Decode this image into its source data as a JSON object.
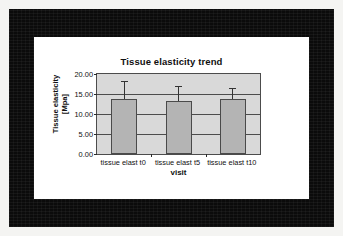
{
  "chart_data": {
    "type": "bar",
    "title": "Tissue elasticity trend",
    "xlabel": "visit",
    "ylabel": "Tissue elasticity [Mpa]",
    "ylabel_line1": "Tissue elasticity",
    "ylabel_line2": "[Mpa]",
    "categories": [
      "tissue elast t0",
      "tissue elast t5",
      "tissue elast t10"
    ],
    "values": [
      13.8,
      13.2,
      13.8
    ],
    "error_high": [
      18.2,
      17.0,
      16.5
    ],
    "errors": [
      4.4,
      3.8,
      2.7
    ],
    "ylim": [
      0,
      20
    ],
    "ytick_values": [
      0,
      5,
      10,
      15,
      20
    ],
    "ytick_labels": [
      "0.00",
      "5.00",
      "10.00",
      "15.00",
      "20.00"
    ],
    "grid": true,
    "legend": "none",
    "bar_color": "#b4b4b4",
    "plot_background": "#d9d9d9",
    "axis_color": "#4c4c4c",
    "frame_color": "#0b0b0b"
  }
}
